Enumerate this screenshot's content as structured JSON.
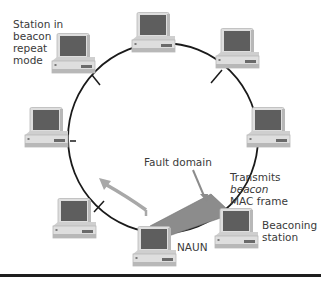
{
  "diagram": {
    "type": "token-ring-beaconing",
    "colors": {
      "ring": "#1a1a1a",
      "fault_domain": "#8c8c8c",
      "arrow": "#a8a8a8",
      "monitor_screen": "#5e5e5e",
      "case": "#dedede",
      "case_shadow": "#b8b8b8",
      "rule": "#1e1e1e"
    },
    "labels": {
      "station_repeat": [
        "Station in",
        "beacon",
        "repeat",
        "mode"
      ],
      "fault_domain": "Fault domain",
      "transmits_line1": "Transmits",
      "transmits_line2": "beacon",
      "transmits_line3": "MAC frame",
      "beaconing_line1": "Beaconing",
      "beaconing_line2": "station",
      "naun": "NAUN"
    },
    "stations": [
      {
        "id": "top",
        "name": "station-top"
      },
      {
        "id": "top-left",
        "name": "station-beacon-repeat"
      },
      {
        "id": "top-right",
        "name": "station-top-right"
      },
      {
        "id": "left",
        "name": "station-left"
      },
      {
        "id": "right",
        "name": "station-right"
      },
      {
        "id": "bottom-left",
        "name": "station-bottom-left"
      },
      {
        "id": "naun",
        "name": "station-naun"
      },
      {
        "id": "beaconing",
        "name": "station-beaconing"
      }
    ]
  }
}
